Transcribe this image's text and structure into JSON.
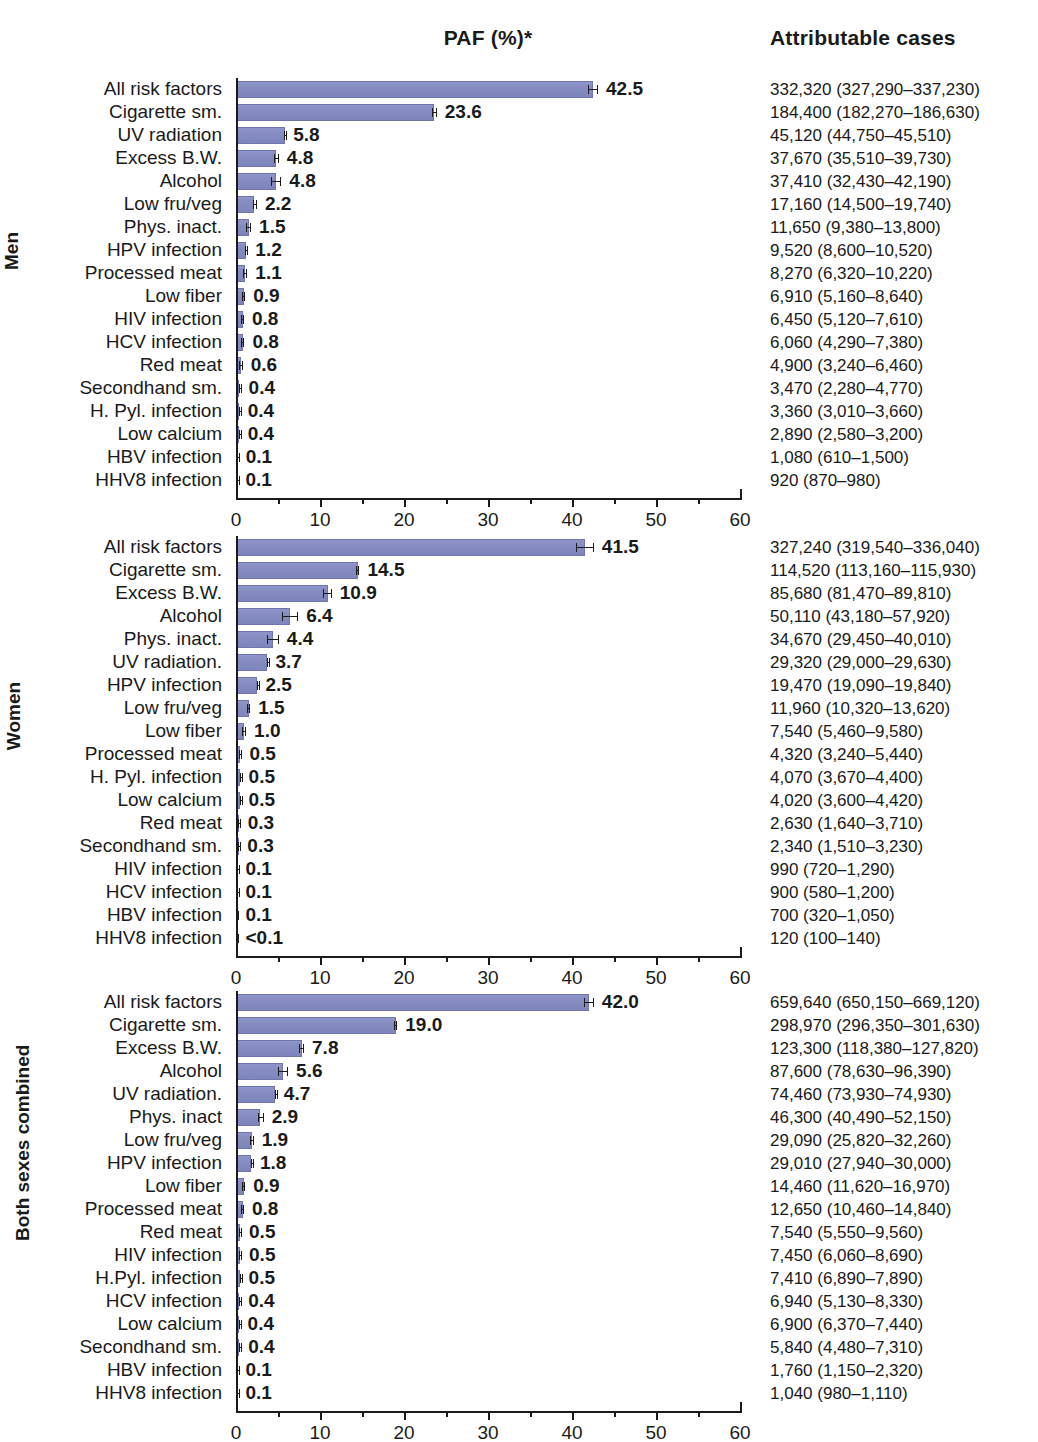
{
  "header": {
    "paf_title": "PAF (%)*",
    "cases_title": "Attributable cases"
  },
  "axis": {
    "ticks": [
      "0",
      "10",
      "20",
      "30",
      "40",
      "50",
      "60"
    ],
    "min": 0,
    "max": 60
  },
  "groups": [
    {
      "id": "men",
      "label": "Men"
    },
    {
      "id": "women",
      "label": "Women"
    },
    {
      "id": "both",
      "label": "Both sexes combined"
    }
  ],
  "chart_data": {
    "type": "bar",
    "title": "PAF (%)*",
    "xlabel": "",
    "ylabel": "",
    "xlim": [
      0,
      60
    ],
    "grid": false,
    "orientation": "horizontal",
    "panels": [
      {
        "name": "Men",
        "categories": [
          "All risk factors",
          "Cigarette sm.",
          "UV radiation",
          "Excess B.W.",
          "Alcohol",
          "Low fru/veg",
          "Phys. inact.",
          "HPV infection",
          "Processed meat",
          "Low fiber",
          "HIV infection",
          "HCV infection",
          "Red meat",
          "Secondhand sm.",
          "H. Pyl. infection",
          "Low calcium",
          "HBV infection",
          "HHV8 infection"
        ],
        "values": [
          42.5,
          23.6,
          5.8,
          4.8,
          4.8,
          2.2,
          1.5,
          1.2,
          1.1,
          0.9,
          0.8,
          0.8,
          0.6,
          0.4,
          0.4,
          0.4,
          0.1,
          0.1
        ],
        "value_labels": [
          "42.5",
          "23.6",
          "5.8",
          "4.8",
          "4.8",
          "2.2",
          "1.5",
          "1.2",
          "1.1",
          "0.9",
          "0.8",
          "0.8",
          "0.6",
          "0.4",
          "0.4",
          "0.4",
          "0.1",
          "0.1"
        ],
        "ci_low": [
          41.9,
          23.3,
          5.75,
          4.5,
          4.2,
          2.0,
          1.2,
          1.1,
          0.8,
          0.7,
          0.6,
          0.55,
          0.4,
          0.3,
          0.35,
          0.35,
          0.08,
          0.09
        ],
        "ci_high": [
          43.1,
          23.9,
          5.85,
          5.1,
          5.4,
          2.5,
          1.8,
          1.35,
          1.35,
          1.1,
          0.95,
          1.0,
          0.8,
          0.55,
          0.45,
          0.45,
          0.2,
          0.12
        ],
        "cases": [
          "332,320 (327,290–337,230)",
          "184,400 (182,270–186,630)",
          "45,120 (44,750–45,510)",
          "37,670 (35,510–39,730)",
          "37,410 (32,430–42,190)",
          "17,160 (14,500–19,740)",
          "11,650 (9,380–13,800)",
          "9,520 (8,600–10,520)",
          "8,270 (6,320–10,220)",
          "6,910 (5,160–8,640)",
          "6,450 (5,120–7,610)",
          "6,060 (4,290–7,380)",
          "4,900 (3,240–6,460)",
          "3,470 (2,280–4,770)",
          "3,360 (3,010–3,660)",
          "2,890 (2,580–3,200)",
          "1,080 (610–1,500)",
          "920 (870–980)"
        ]
      },
      {
        "name": "Women",
        "categories": [
          "All risk factors",
          "Cigarette sm.",
          "Excess B.W.",
          "Alcohol",
          "Phys. inact.",
          "UV radiation.",
          "HPV infection",
          "Low fru/veg",
          "Low fiber",
          "Processed meat",
          "H. Pyl. infection",
          "Low calcium",
          "Red meat",
          "Secondhand sm.",
          "HIV infection",
          "HCV infection",
          "HBV infection",
          "HHV8 infection"
        ],
        "values": [
          41.5,
          14.5,
          10.9,
          6.4,
          4.4,
          3.7,
          2.5,
          1.5,
          1.0,
          0.5,
          0.5,
          0.5,
          0.3,
          0.3,
          0.1,
          0.1,
          0.1,
          0.05
        ],
        "value_labels": [
          "41.5",
          "14.5",
          "10.9",
          "6.4",
          "4.4",
          "3.7",
          "2.5",
          "1.5",
          "1.0",
          "0.5",
          "0.5",
          "0.5",
          "0.3",
          "0.3",
          "0.1",
          "0.1",
          "0.1",
          "<0.1"
        ],
        "ci_low": [
          40.5,
          14.3,
          10.4,
          5.5,
          3.7,
          3.66,
          2.45,
          1.3,
          0.7,
          0.4,
          0.45,
          0.45,
          0.2,
          0.2,
          0.07,
          0.06,
          0.04,
          0.04
        ],
        "ci_high": [
          42.6,
          14.7,
          11.4,
          7.4,
          5.1,
          3.74,
          2.55,
          1.7,
          1.2,
          0.65,
          0.55,
          0.55,
          0.45,
          0.4,
          0.14,
          0.14,
          0.13,
          0.06
        ],
        "cases": [
          "327,240 (319,540–336,040)",
          "114,520 (113,160–115,930)",
          "85,680 (81,470–89,810)",
          "50,110 (43,180–57,920)",
          "34,670 (29,450–40,010)",
          "29,320 (29,000–29,630)",
          "19,470 (19,090–19,840)",
          "11,960 (10,320–13,620)",
          "7,540 (5,460–9,580)",
          "4,320 (3,240–5,440)",
          "4,070 (3,670–4,400)",
          "4,020 (3,600–4,420)",
          "2,630 (1,640–3,710)",
          "2,340 (1,510–3,230)",
          "990 (720–1,290)",
          "900 (580–1,200)",
          "700 (320–1,050)",
          "120 (100–140)"
        ]
      },
      {
        "name": "Both sexes combined",
        "categories": [
          "All risk factors",
          "Cigarette sm.",
          "Excess B.W.",
          "Alcohol",
          "UV radiation.",
          "Phys. inact",
          "Low fru/veg",
          "HPV infection",
          "Low fiber",
          "Processed meat",
          "Red meat",
          "HIV infection",
          "H.Pyl. infection",
          "HCV infection",
          "Low calcium",
          "Secondhand sm.",
          "HBV infection",
          "HHV8 infection"
        ],
        "values": [
          42.0,
          19.0,
          7.8,
          5.6,
          4.7,
          2.9,
          1.9,
          1.8,
          0.9,
          0.8,
          0.5,
          0.5,
          0.5,
          0.4,
          0.4,
          0.4,
          0.1,
          0.1
        ],
        "value_labels": [
          "42.0",
          "19.0",
          "7.8",
          "5.6",
          "4.7",
          "2.9",
          "1.9",
          "1.8",
          "0.9",
          "0.8",
          "0.5",
          "0.5",
          "0.5",
          "0.4",
          "0.4",
          "0.4",
          "0.1",
          "0.1"
        ],
        "ci_low": [
          41.4,
          18.8,
          7.5,
          5.0,
          4.66,
          2.6,
          1.7,
          1.75,
          0.75,
          0.65,
          0.35,
          0.4,
          0.45,
          0.3,
          0.37,
          0.3,
          0.07,
          0.09
        ],
        "ci_high": [
          42.6,
          19.2,
          8.1,
          6.2,
          4.74,
          3.3,
          2.1,
          1.9,
          1.1,
          0.95,
          0.6,
          0.6,
          0.55,
          0.5,
          0.43,
          0.5,
          0.15,
          0.11
        ],
        "cases": [
          "659,640 (650,150–669,120)",
          "298,970 (296,350–301,630)",
          "123,300 (118,380–127,820)",
          "87,600 (78,630–96,390)",
          "74,460 (73,930–74,930)",
          "46,300 (40,490–52,150)",
          "29,090 (25,820–32,260)",
          "29,010 (27,940–30,000)",
          "14,460 (11,620–16,970)",
          "12,650 (10,460–14,840)",
          "7,540 (5,550–9,560)",
          "7,450 (6,060–8,690)",
          "7,410 (6,890–7,890)",
          "6,940 (5,130–8,330)",
          "6,900 (6,370–7,440)",
          "5,840 (4,480–7,310)",
          "1,760 (1,150–2,320)",
          "1,040 (980–1,110)"
        ]
      }
    ]
  },
  "colors": {
    "bar": "#868cc0",
    "bar_border": "#6d74ae",
    "axis": "#1b1b1b",
    "text": "#1a1a1a"
  }
}
